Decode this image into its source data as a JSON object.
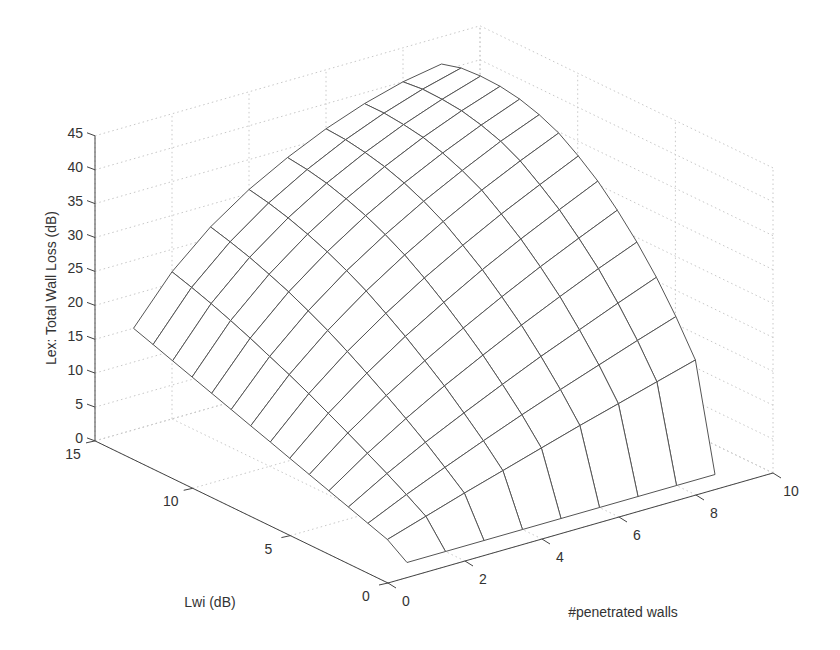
{
  "chart_data": {
    "type": "surface",
    "title": "",
    "xlabel": "#penetrated walls",
    "ylabel": "Lwi (dB)",
    "zlabel": "Lex: Total Wall Loss (dB)",
    "x_ticks": [
      "0",
      "2",
      "4",
      "6",
      "8",
      "10"
    ],
    "y_ticks": [
      "0",
      "5",
      "10",
      "15"
    ],
    "z_ticks": [
      "0",
      "5",
      "10",
      "15",
      "20",
      "25",
      "30",
      "35",
      "40",
      "45"
    ],
    "xlim": [
      0,
      10
    ],
    "ylim": [
      0,
      15
    ],
    "zlim": [
      0,
      45
    ],
    "grid": true,
    "mesh_color": "#555555",
    "x": [
      1,
      2,
      3,
      4,
      5,
      6,
      7,
      8,
      9
    ],
    "y": [
      1,
      2,
      3,
      4,
      5,
      6,
      7,
      8,
      9,
      10,
      11,
      12,
      13,
      14,
      15
    ],
    "z_note": "rows indexed by y (Lwi), columns by x (walls); Lex increases with both walls and Lwi",
    "z": [
      [
        0.0,
        0.0,
        0.0,
        0.0,
        0.0,
        0.0,
        0.0,
        0.0,
        0.0
      ],
      [
        2.0,
        3.8,
        5.6,
        7.3,
        9.0,
        10.7,
        12.3,
        13.9,
        15.5
      ],
      [
        3.0,
        5.6,
        8.0,
        10.3,
        12.5,
        14.6,
        16.6,
        18.6,
        20.5
      ],
      [
        4.0,
        7.3,
        10.3,
        13.0,
        15.6,
        18.1,
        20.4,
        22.7,
        24.9
      ],
      [
        5.0,
        8.9,
        12.4,
        15.6,
        18.5,
        21.3,
        23.9,
        26.4,
        28.7
      ],
      [
        6.0,
        10.5,
        14.4,
        17.9,
        21.1,
        24.1,
        26.9,
        29.5,
        32.0
      ],
      [
        7.0,
        12.0,
        16.3,
        20.1,
        23.5,
        26.7,
        29.6,
        32.3,
        34.9
      ],
      [
        8.0,
        13.5,
        18.1,
        22.1,
        25.7,
        28.9,
        31.9,
        34.6,
        37.2
      ],
      [
        9.0,
        14.9,
        19.8,
        24.0,
        27.7,
        31.0,
        34.0,
        36.7,
        39.2
      ],
      [
        10.0,
        16.2,
        21.3,
        25.6,
        29.3,
        32.6,
        35.5,
        38.2,
        40.5
      ],
      [
        11.0,
        17.5,
        22.7,
        27.0,
        30.7,
        33.9,
        36.7,
        39.2,
        41.4
      ],
      [
        12.0,
        18.7,
        23.9,
        28.2,
        31.8,
        34.9,
        37.6,
        39.9,
        41.9
      ],
      [
        13.0,
        19.8,
        25.0,
        29.2,
        32.7,
        35.6,
        38.1,
        40.2,
        42.0
      ],
      [
        14.0,
        20.8,
        25.9,
        30.0,
        33.3,
        36.1,
        38.4,
        40.3,
        41.8
      ],
      [
        15.0,
        21.7,
        26.7,
        30.6,
        33.7,
        36.3,
        38.4,
        40.0,
        41.0
      ]
    ]
  }
}
